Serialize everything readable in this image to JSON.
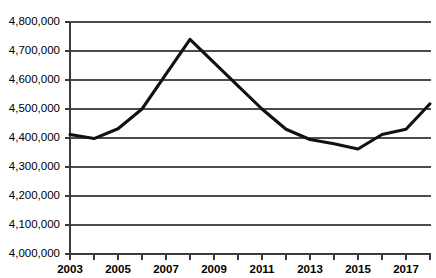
{
  "chart_data": {
    "type": "line",
    "title": "",
    "subtitle": "",
    "xlabel": "",
    "ylabel": "",
    "xlim": [
      2003,
      2018
    ],
    "ylim": [
      4000000,
      4800000
    ],
    "grid": true,
    "legend": null,
    "y_ticks": [
      "4,800,000",
      "4,700,000",
      "4,600,000",
      "4,500,000",
      "4,400,000",
      "4,300,000",
      "4,200,000",
      "4,100,000",
      "4,000,000"
    ],
    "y_tick_values": [
      4800000,
      4700000,
      4600000,
      4500000,
      4400000,
      4300000,
      4200000,
      4100000,
      4000000
    ],
    "x_tick_labels": [
      "2003",
      "2005",
      "2007",
      "2009",
      "2011",
      "2013",
      "2015",
      "2017"
    ],
    "x_tick_values": [
      2003,
      2005,
      2007,
      2009,
      2011,
      2013,
      2015,
      2017
    ],
    "x_minor_ticks": [
      2003,
      2004,
      2005,
      2006,
      2007,
      2008,
      2009,
      2010,
      2011,
      2012,
      2013,
      2014,
      2015,
      2016,
      2017,
      2018
    ],
    "x": [
      2003,
      2004,
      2005,
      2006,
      2007,
      2008,
      2009,
      2010,
      2011,
      2012,
      2013,
      2014,
      2015,
      2016,
      2017,
      2018
    ],
    "values": [
      4412000,
      4398000,
      4432000,
      4500000,
      4620000,
      4740000,
      4660000,
      4580000,
      4500000,
      4430000,
      4395000,
      4380000,
      4362000,
      4412000,
      4430000,
      4518000
    ],
    "series": [
      {
        "name": "series-1",
        "color": "#111111",
        "values": [
          4412000,
          4398000,
          4432000,
          4500000,
          4620000,
          4740000,
          4660000,
          4580000,
          4500000,
          4430000,
          4395000,
          4380000,
          4362000,
          4412000,
          4430000,
          4518000
        ]
      }
    ]
  },
  "colors": {
    "line": "#111111",
    "grid": "#4d4d4d",
    "axis": "#3a3a3a",
    "background": "#ffffff"
  }
}
